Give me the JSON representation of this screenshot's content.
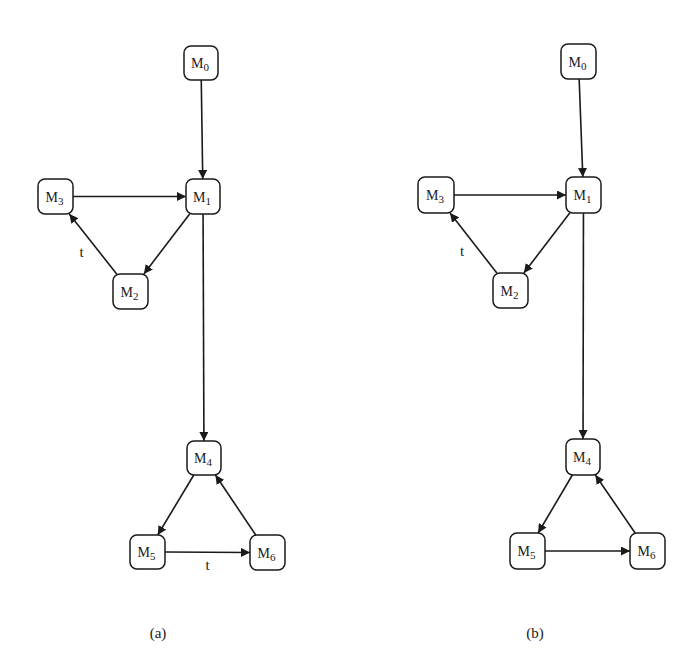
{
  "figure": {
    "panels": [
      {
        "id": "a",
        "caption": "(a)",
        "nodes": [
          {
            "id": "M0",
            "base": "M",
            "sub": "0",
            "x": 184,
            "y": 46,
            "w": 34,
            "h": 34
          },
          {
            "id": "M1",
            "base": "M",
            "sub": "1",
            "x": 186,
            "y": 179,
            "w": 34,
            "h": 35
          },
          {
            "id": "M3",
            "base": "M",
            "sub": "3",
            "x": 38,
            "y": 179,
            "w": 35,
            "h": 35
          },
          {
            "id": "M2",
            "base": "M",
            "sub": "2",
            "x": 113,
            "y": 274,
            "w": 35,
            "h": 35
          },
          {
            "id": "M4",
            "base": "M",
            "sub": "4",
            "x": 187,
            "y": 441,
            "w": 34,
            "h": 34
          },
          {
            "id": "M5",
            "base": "M",
            "sub": "5",
            "x": 130,
            "y": 535,
            "w": 35,
            "h": 34
          },
          {
            "id": "M6",
            "base": "M",
            "sub": "6",
            "x": 250,
            "y": 535,
            "w": 35,
            "h": 35
          }
        ],
        "edges": [
          {
            "from": "M0",
            "to": "M1",
            "label": ""
          },
          {
            "from": "M3",
            "to": "M1",
            "label": ""
          },
          {
            "from": "M1",
            "to": "M2",
            "label": ""
          },
          {
            "from": "M2",
            "to": "M3",
            "label": "t"
          },
          {
            "from": "M1",
            "to": "M4",
            "label": ""
          },
          {
            "from": "M4",
            "to": "M5",
            "label": ""
          },
          {
            "from": "M5",
            "to": "M6",
            "label": "t"
          },
          {
            "from": "M6",
            "to": "M4",
            "label": ""
          }
        ]
      },
      {
        "id": "b",
        "caption": "(b)",
        "nodes": [
          {
            "id": "M0",
            "base": "M",
            "sub": "0",
            "x": 561,
            "y": 44,
            "w": 35,
            "h": 35
          },
          {
            "id": "M1",
            "base": "M",
            "sub": "1",
            "x": 566,
            "y": 177,
            "w": 35,
            "h": 36
          },
          {
            "id": "M3",
            "base": "M",
            "sub": "3",
            "x": 418,
            "y": 177,
            "w": 36,
            "h": 36
          },
          {
            "id": "M2",
            "base": "M",
            "sub": "2",
            "x": 493,
            "y": 273,
            "w": 35,
            "h": 35
          },
          {
            "id": "M4",
            "base": "M",
            "sub": "4",
            "x": 566,
            "y": 439,
            "w": 34,
            "h": 36
          },
          {
            "id": "M5",
            "base": "M",
            "sub": "5",
            "x": 510,
            "y": 533,
            "w": 35,
            "h": 36
          },
          {
            "id": "M6",
            "base": "M",
            "sub": "6",
            "x": 630,
            "y": 533,
            "w": 35,
            "h": 36
          }
        ],
        "edges": [
          {
            "from": "M0",
            "to": "M1",
            "label": ""
          },
          {
            "from": "M3",
            "to": "M1",
            "label": ""
          },
          {
            "from": "M1",
            "to": "M2",
            "label": ""
          },
          {
            "from": "M2",
            "to": "M3",
            "label": "t"
          },
          {
            "from": "M1",
            "to": "M4",
            "label": ""
          },
          {
            "from": "M4",
            "to": "M5",
            "label": ""
          },
          {
            "from": "M5",
            "to": "M6",
            "label": ""
          },
          {
            "from": "M6",
            "to": "M4",
            "label": ""
          }
        ]
      }
    ],
    "captions": {
      "a": "(a)",
      "b": "(b)"
    },
    "colors": {
      "stroke": "#1a1a1a",
      "background": "#ffffff"
    }
  }
}
